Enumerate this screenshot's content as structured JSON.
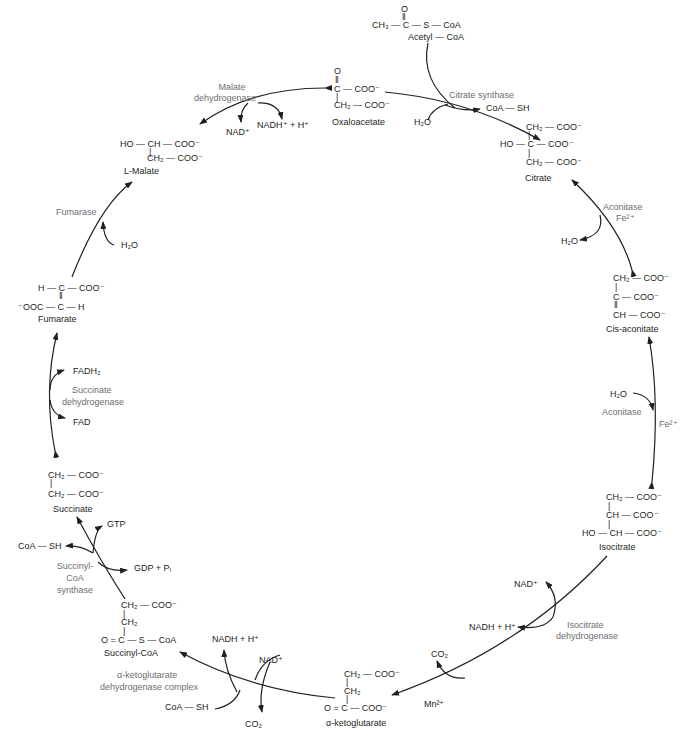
{
  "diagram": {
    "metabolites": {
      "acetyl_coa": {
        "name": "Acetyl — CoA",
        "formula": [
          "O",
          "‖",
          "CH₃ — C — S — CoA"
        ]
      },
      "oxaloacetate": {
        "name": "Oxaloacetate",
        "formula": [
          "O",
          "‖",
          "C — COO⁻",
          "|",
          "CH₂ — COO⁻"
        ]
      },
      "citrate": {
        "name": "Citrate",
        "formula": [
          "CH₂ — COO⁻",
          "|",
          "HO — C — COO⁻",
          "|",
          "CH₂ — COO⁻"
        ]
      },
      "cis_aconitate": {
        "name": "Cis-aconitate",
        "formula": [
          "CH₂ — COO⁻",
          "|",
          "C — COO⁻",
          "‖",
          "CH — COO⁻"
        ]
      },
      "isocitrate": {
        "name": "Isocitrate",
        "formula": [
          "CH₂ — COO⁻",
          "|",
          "CH — COO⁻",
          "|",
          "HO — CH — COO⁻"
        ]
      },
      "alpha_ketoglutarate": {
        "name": "α-ketoglutarate",
        "formula": [
          "CH₂ — COO⁻",
          "|",
          "CH₂",
          "|",
          "O = C — COO⁻"
        ]
      },
      "succinyl_coa": {
        "name": "Succinyl-CoA",
        "formula": [
          "CH₂ — COO⁻",
          "|",
          "CH₂",
          "|",
          "O = C — S — CoA"
        ]
      },
      "succinate": {
        "name": "Succinate",
        "formula": [
          "CH₂ — COO⁻",
          "|",
          "CH₂ — COO⁻"
        ]
      },
      "fumarate": {
        "name": "Fumarate",
        "formula": [
          "H — C — COO⁻",
          "‖",
          "⁻OOC — C — H"
        ]
      },
      "malate": {
        "name": "L-Malate",
        "formula": [
          "HO — CH — COO⁻",
          "|",
          "CH₂ — COO⁻"
        ]
      }
    },
    "enzymes": {
      "citrate_synthase": "Citrate synthase",
      "aconitase_1": "Aconitase",
      "aconitase_1_cofactor": "Fe²⁺",
      "aconitase_2": "Aconitase",
      "aconitase_2_cofactor": "Fe²⁺",
      "isocitrate_dh_1": "Isocitrate",
      "isocitrate_dh_2": "dehydrogenase",
      "isocitrate_dh_cofactor": "Mn²⁺",
      "akg_dh_1": "α-ketoglutarate",
      "akg_dh_2": "dehydrogenase complex",
      "succinyl_coa_synthase_1": "Succinyl-",
      "succinyl_coa_synthase_2": "CoA",
      "succinyl_coa_synthase_3": "synthase",
      "succinate_dh_1": "Succinate",
      "succinate_dh_2": "dehydrogenase",
      "fumarase": "Fumarase",
      "malate_dh_1": "Malate",
      "malate_dh_2": "dehydrogenase"
    },
    "side_species": {
      "coa_sh_citrate": "CoA — SH",
      "h2o_citrate": "H₂O",
      "h2o_aconitase_1": "H₂O",
      "h2o_aconitase_2": "H₂O",
      "nad_isocitrate": "NAD⁺",
      "nadh_isocitrate": "NADH + H⁺",
      "co2_isocitrate": "CO₂",
      "nadh_akg": "NADH + H⁺",
      "nad_akg": "NAD⁺",
      "coa_sh_akg": "CoA — SH",
      "co2_akg": "CO₂",
      "gtp": "GTP",
      "coa_sh_succinyl": "CoA — SH",
      "gdp_pi": "GDP + Pᵢ",
      "fadh2": "FADH₂",
      "fad": "FAD",
      "h2o_fumarase": "H₂O",
      "nad_malate": "NAD⁺",
      "nadh_malate": "NADH⁺ + H⁺"
    }
  }
}
